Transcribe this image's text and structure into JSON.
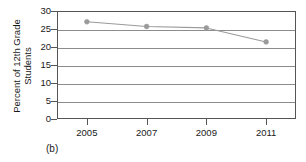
{
  "caption": "(b)",
  "artifacts": {
    "left": "~",
    "right": "~"
  },
  "colors": {
    "line": "#9a9a9a",
    "marker": "#9a9a9a",
    "grid": "#8c8c8c",
    "frame": "#555555",
    "text": "#1a1a1a",
    "background": "#ffffff"
  },
  "chart_data": {
    "type": "line",
    "title": "",
    "xlabel": "",
    "ylabel_lines": [
      "Percent of 12th Grade",
      "Students"
    ],
    "ylabel": "Percent of 12th Grade Students",
    "x": [
      2005,
      2007,
      2009,
      2011
    ],
    "categories": [
      "2005",
      "2007",
      "2009",
      "2011"
    ],
    "values": [
      27.0,
      25.7,
      25.3,
      21.4
    ],
    "series": [
      {
        "name": "Percent of 12th Grade Students",
        "values": [
          27.0,
          25.7,
          25.3,
          21.4
        ]
      }
    ],
    "ylim": [
      0,
      30
    ],
    "yticks": [
      0,
      5,
      10,
      15,
      20,
      25,
      30
    ],
    "ytick_labels": [
      "0",
      "5",
      "10",
      "15",
      "20",
      "25",
      "30"
    ],
    "xticks": [
      2005,
      2007,
      2009,
      2011
    ],
    "xtick_labels": [
      "2005",
      "2007",
      "2009",
      "2011"
    ],
    "xlim": [
      2004,
      2012
    ],
    "grid": true,
    "grid_axis": "y",
    "legend": false,
    "legend_position": "none",
    "markers": "circle"
  }
}
